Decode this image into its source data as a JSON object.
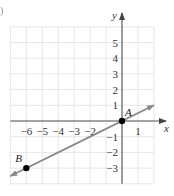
{
  "chart_data": {
    "type": "line",
    "title": "",
    "xlabel": "x",
    "ylabel": "y",
    "xlim": [
      -7,
      2
    ],
    "ylim": [
      -4,
      6
    ],
    "grid": true,
    "x_tick_labels": [
      "−6",
      "−5",
      "−4",
      "−3",
      "−2",
      "1"
    ],
    "x_tick_values": [
      -6,
      -5,
      -4,
      -3,
      -2,
      1
    ],
    "y_tick_labels": [
      "5",
      "4",
      "3",
      "2",
      "1",
      "−1",
      "−2",
      "−3"
    ],
    "y_tick_values": [
      5,
      4,
      3,
      2,
      1,
      -1,
      -2,
      -3
    ],
    "series": [
      {
        "name": "line AB",
        "color": "#8a8a8a",
        "x": [
          -7,
          2
        ],
        "y": [
          -3.5,
          1
        ],
        "arrows": "both"
      }
    ],
    "points": [
      {
        "label": "A",
        "x": 0,
        "y": 0,
        "color": "#000000"
      },
      {
        "label": "B",
        "x": -6,
        "y": -3,
        "color": "#000000"
      }
    ],
    "part_label": ")"
  },
  "colors": {
    "grid": "#e0e0e0",
    "axis": "#555555",
    "line": "#8a8a8a",
    "point": "#000000"
  }
}
